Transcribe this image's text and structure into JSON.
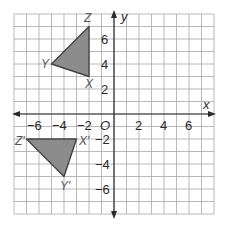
{
  "diagram": {
    "type": "coordinate-plane",
    "transformation": "rotation 90° counterclockwise about origin",
    "grid": {
      "x_min": -8,
      "x_max": 8,
      "y_min": -8,
      "y_max": 8,
      "origin_px": [
        114,
        114
      ],
      "unit_px": 12.5,
      "grid_color": "#a8a8a8",
      "axis_color": "#2a2a2a"
    },
    "axes": {
      "x_label": "x",
      "y_label": "y",
      "origin_label": "O",
      "x_ticks": [
        {
          "value": -6,
          "label": "−6"
        },
        {
          "value": -4,
          "label": "−4"
        },
        {
          "value": -2,
          "label": "−2"
        },
        {
          "value": 2,
          "label": "2"
        },
        {
          "value": 4,
          "label": "4"
        },
        {
          "value": 6,
          "label": "6"
        }
      ],
      "y_ticks": [
        {
          "value": 6,
          "label": "6"
        },
        {
          "value": 4,
          "label": "4"
        },
        {
          "value": 2,
          "label": "2"
        },
        {
          "value": -2,
          "label": "−2"
        },
        {
          "value": -4,
          "label": "−4"
        },
        {
          "value": -6,
          "label": "−6"
        }
      ]
    },
    "triangles": [
      {
        "name": "XYZ",
        "fill": "#8c8c8c",
        "vertices": [
          {
            "label": "X",
            "x": -2,
            "y": 3
          },
          {
            "label": "Y",
            "x": -5,
            "y": 4
          },
          {
            "label": "Z",
            "x": -2,
            "y": 7
          }
        ]
      },
      {
        "name": "X'Y'Z'",
        "fill": "#8c8c8c",
        "vertices": [
          {
            "label": "X'",
            "x": -3,
            "y": -2
          },
          {
            "label": "Y'",
            "x": -4,
            "y": -5
          },
          {
            "label": "Z'",
            "x": -7,
            "y": -2
          }
        ]
      }
    ]
  },
  "labels": {
    "x_axis": "x",
    "y_axis": "y",
    "origin": "O",
    "X": "X",
    "Y": "Y",
    "Z": "Z",
    "Xp": "X'",
    "Yp": "Y'",
    "Zp": "Z'",
    "xt_m6": "−6",
    "xt_m4": "−4",
    "xt_m2": "−2",
    "xt_2": "2",
    "xt_4": "4",
    "xt_6": "6",
    "yt_6": "6",
    "yt_4": "4",
    "yt_2": "2",
    "yt_m2": "−2",
    "yt_m4": "−4",
    "yt_m6": "−6"
  }
}
